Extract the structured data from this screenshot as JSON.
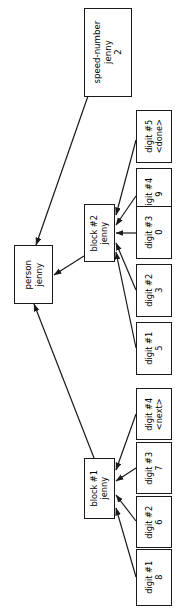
{
  "diagram": {
    "type": "object-reference-graph",
    "orientation": "rotated-90-ccw",
    "background_color": "#ffffff",
    "stroke_color": "#1a1a1a",
    "text_color": "#000000",
    "nodes": [
      {
        "id": "speed-number",
        "name": "speed-number-node",
        "title": "speed-number",
        "owner": "jenny",
        "value": "2",
        "x": 84,
        "y": 8,
        "w": 48,
        "h": 89,
        "big": true
      },
      {
        "id": "person",
        "name": "person-node",
        "title": "person",
        "owner": "jenny",
        "value": "",
        "x": 14,
        "y": 245,
        "w": 39,
        "h": 59,
        "big": true
      },
      {
        "id": "block2",
        "name": "block-2-node",
        "title": "block #2",
        "owner": "jenny",
        "value": "",
        "x": 84,
        "y": 204,
        "w": 31,
        "h": 58,
        "big": false
      },
      {
        "id": "block1",
        "name": "block-1-node",
        "title": "block #1",
        "owner": "jenny",
        "value": "",
        "x": 84,
        "y": 458,
        "w": 31,
        "h": 61,
        "big": false
      },
      {
        "id": "b2-digit5",
        "name": "block-2-digit-5-node",
        "title": "digit #5",
        "owner": "",
        "value": "<done>",
        "x": 136,
        "y": 110,
        "w": 36,
        "h": 53,
        "big": false
      },
      {
        "id": "b2-digit4",
        "name": "block-2-digit-4-node",
        "title": "digit #4",
        "owner": "",
        "value": "9",
        "x": 136,
        "y": 168,
        "w": 36,
        "h": 53,
        "big": false
      },
      {
        "id": "b2-digit3",
        "name": "block-2-digit-3-node",
        "title": "digit #3",
        "owner": "",
        "value": "0",
        "x": 136,
        "y": 206,
        "w": 36,
        "h": 53,
        "big": false
      },
      {
        "id": "b2-digit2",
        "name": "block-2-digit-2-node",
        "title": "digit #2",
        "owner": "",
        "value": "3",
        "x": 136,
        "y": 264,
        "w": 36,
        "h": 53,
        "big": false
      },
      {
        "id": "b2-digit1",
        "name": "block-2-digit-1-node",
        "title": "digit #1",
        "owner": "",
        "value": "5",
        "x": 136,
        "y": 322,
        "w": 36,
        "h": 53,
        "big": false
      },
      {
        "id": "b1-digit4",
        "name": "block-1-digit-4-node",
        "title": "digit #4",
        "owner": "",
        "value": "<next>",
        "x": 136,
        "y": 388,
        "w": 36,
        "h": 52,
        "big": false
      },
      {
        "id": "b1-digit3",
        "name": "block-1-digit-3-node",
        "title": "digit #3",
        "owner": "",
        "value": "7",
        "x": 136,
        "y": 442,
        "w": 36,
        "h": 52,
        "big": false
      },
      {
        "id": "b1-digit2",
        "name": "block-1-digit-2-node",
        "title": "digit #2",
        "owner": "",
        "value": "6",
        "x": 136,
        "y": 496,
        "w": 36,
        "h": 52,
        "big": false
      },
      {
        "id": "b1-digit1",
        "name": "block-1-digit-1-node",
        "title": "digit #1",
        "owner": "",
        "value": "8",
        "x": 136,
        "y": 549,
        "w": 36,
        "h": 57,
        "big": false
      }
    ],
    "edges": [
      {
        "id": "e-speed-person",
        "name": "edge-speed-number-to-person",
        "from": "speed-number",
        "to": "person",
        "x1": 88,
        "y1": 96,
        "x2": 36,
        "y2": 245
      },
      {
        "id": "e-block2-person",
        "name": "edge-block-2-to-person",
        "from": "block2",
        "to": "person",
        "x1": 84,
        "y1": 256,
        "x2": 54,
        "y2": 275
      },
      {
        "id": "e-block1-person",
        "name": "edge-block-1-to-person",
        "from": "block1",
        "to": "person",
        "x1": 94,
        "y1": 458,
        "x2": 34,
        "y2": 304
      },
      {
        "id": "e-b2d5",
        "name": "edge-digit-5-to-block-2",
        "from": "b2-digit5",
        "to": "block2",
        "x1": 136,
        "y1": 140,
        "x2": 116,
        "y2": 215
      },
      {
        "id": "e-b2d4",
        "name": "edge-digit-4-to-block-2",
        "from": "b2-digit4",
        "to": "block2",
        "x1": 136,
        "y1": 196,
        "x2": 116,
        "y2": 225
      },
      {
        "id": "e-b2d3",
        "name": "edge-digit-3-to-block-2",
        "from": "b2-digit3",
        "to": "block2",
        "x1": 136,
        "y1": 233,
        "x2": 116,
        "y2": 233
      },
      {
        "id": "e-b2d2",
        "name": "edge-digit-2-to-block-2",
        "from": "b2-digit2",
        "to": "block2",
        "x1": 136,
        "y1": 290,
        "x2": 116,
        "y2": 243
      },
      {
        "id": "e-b2d1",
        "name": "edge-digit-1-to-block-2",
        "from": "b2-digit1",
        "to": "block2",
        "x1": 136,
        "y1": 348,
        "x2": 116,
        "y2": 252
      },
      {
        "id": "e-b1d4",
        "name": "edge-digit-4-to-block-1",
        "from": "b1-digit4",
        "to": "block1",
        "x1": 136,
        "y1": 414,
        "x2": 116,
        "y2": 470
      },
      {
        "id": "e-b1d3",
        "name": "edge-digit-3-to-block-1",
        "from": "b1-digit3",
        "to": "block1",
        "x1": 136,
        "y1": 468,
        "x2": 116,
        "y2": 481
      },
      {
        "id": "e-b1d2",
        "name": "edge-digit-2-to-block-1",
        "from": "b1-digit2",
        "to": "block1",
        "x1": 136,
        "y1": 521,
        "x2": 116,
        "y2": 495
      },
      {
        "id": "e-b1d1",
        "name": "edge-digit-1-to-block-1",
        "from": "b1-digit1",
        "to": "block1",
        "x1": 136,
        "y1": 577,
        "x2": 116,
        "y2": 508
      }
    ]
  }
}
